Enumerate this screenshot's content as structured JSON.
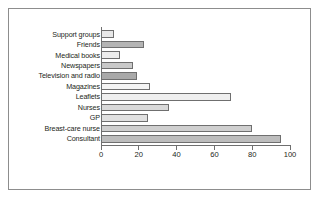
{
  "chart_data": {
    "type": "bar",
    "orientation": "horizontal",
    "title": "",
    "xlabel": "",
    "ylabel": "",
    "xlim": [
      0,
      100
    ],
    "xticks": [
      0,
      20,
      40,
      60,
      80,
      100
    ],
    "grid": false,
    "legend": "none",
    "categories": [
      "Support groups",
      "Friends",
      "Medical books",
      "Newspapers",
      "Television and radio",
      "Magazines",
      "Leaflets",
      "Nurses",
      "GP",
      "Breast-care nurse",
      "Consultant"
    ],
    "values": [
      7,
      23,
      10,
      17,
      19,
      26,
      69,
      36,
      25,
      80,
      95
    ],
    "bar_colors": [
      "#e8e8e8",
      "#b4b4b4",
      "#ededed",
      "#c9c9c9",
      "#a9a9a9",
      "#f4f4f4",
      "#efefef",
      "#d9d9d9",
      "#e0e0e0",
      "#cfcfcf",
      "#bdbdbd"
    ]
  },
  "style": {
    "frame_color": "#8d8d8d",
    "axis_color": "#6f6f6f",
    "bar_border": "#6f6f6f",
    "text_color": "#231f20",
    "background": "#ffffff"
  }
}
